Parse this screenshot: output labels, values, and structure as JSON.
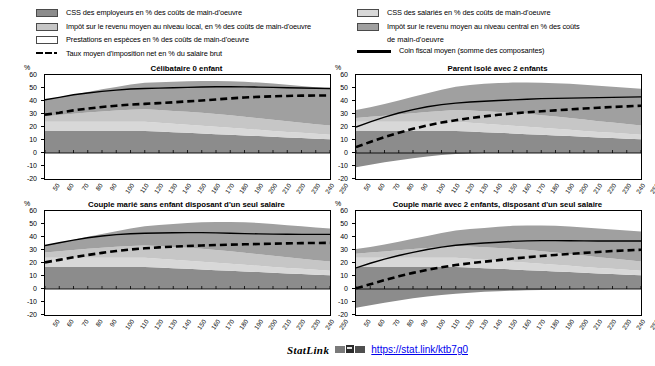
{
  "legend": {
    "left": [
      {
        "key": "area",
        "swatch": "employer",
        "color": "#8c8c8c",
        "label": "CSS des employeurs en % des coûts de main-d'oeuvre"
      },
      {
        "key": "area",
        "swatch": "local",
        "color": "#c6c6c6",
        "label": "Impôt sur le revenu moyen au niveau local, en % des coûts de main-d'oeuvre"
      },
      {
        "key": "area",
        "swatch": "benefit",
        "color": "#ffffff",
        "label": "Prestations en espèces en % des coûts de main-d'oeuvre"
      },
      {
        "key": "dashed",
        "color": "#000000",
        "label": "Taux moyen d'imposition net en % du salaire brut"
      }
    ],
    "right": [
      {
        "key": "area",
        "swatch": "employee",
        "color": "#d8d8d8",
        "label": "CSS des salariés en % des coûts de main-d'oeuvre"
      },
      {
        "key": "area",
        "swatch": "central",
        "color": "#a0a0a0",
        "label": "Impôt sur le revenu moyen au niveau central en %  des coûts",
        "label2": "de main-d'oeuvre"
      },
      {
        "key": "solid",
        "color": "#000000",
        "label": "Coin fiscal moyen (somme des composantes)"
      }
    ]
  },
  "axis": {
    "y_unit": "%",
    "y_ticks": [
      60,
      50,
      40,
      30,
      20,
      10,
      0,
      -10,
      -20
    ],
    "y_min": -20,
    "y_max": 60,
    "x_ticks": [
      50,
      60,
      70,
      80,
      90,
      100,
      110,
      120,
      130,
      140,
      150,
      160,
      170,
      180,
      190,
      200,
      210,
      220,
      230,
      240,
      250
    ],
    "x_min": 50,
    "x_max": 250
  },
  "footer": {
    "statlink_word": "StatLink",
    "url": "https://stat.link/ktb7g0"
  },
  "chart_data": [
    {
      "type": "area",
      "title": "Célibataire 0 enfant",
      "xlabel": "",
      "ylabel": "%",
      "xlim": [
        50,
        250
      ],
      "ylim": [
        -20,
        60
      ],
      "grid": false,
      "legend_position": "top",
      "x": [
        50,
        60,
        70,
        80,
        90,
        100,
        110,
        120,
        130,
        140,
        150,
        160,
        170,
        180,
        190,
        200,
        210,
        220,
        230,
        240,
        250
      ],
      "series": [
        {
          "name": "CSS des employeurs en % des coûts de main-d'oeuvre",
          "color": "#8c8c8c",
          "values": [
            17,
            17,
            17,
            17,
            17,
            17,
            17,
            17,
            16.5,
            16,
            15.5,
            15,
            14.5,
            14,
            13.5,
            13,
            12.5,
            12,
            11.5,
            11,
            10.5
          ]
        },
        {
          "name": "CSS des salariés en % des coûts de main-d'oeuvre",
          "color": "#d8d8d8",
          "values": [
            7,
            7,
            7,
            7,
            7,
            7,
            7,
            7,
            6.8,
            6.5,
            6.2,
            6,
            5.7,
            5.4,
            5.1,
            4.8,
            4.5,
            4.2,
            4,
            3.8,
            3.6
          ]
        },
        {
          "name": "Impôt sur le revenu moyen au niveau local, en % des coûts de main-d'oeuvre",
          "color": "#c6c6c6",
          "values": [
            4,
            5.2,
            6.2,
            7.2,
            8.0,
            8.6,
            9.2,
            9.6,
            9.8,
            9.9,
            10.0,
            10.0,
            9.8,
            9.6,
            9.3,
            9.0,
            8.6,
            8.2,
            7.8,
            7.4,
            7.0
          ]
        },
        {
          "name": "Impôt sur le revenu moyen au niveau central en %  des coûts de main-d'oeuvre",
          "color": "#a0a0a0",
          "values": [
            13,
            13.6,
            14.6,
            15.8,
            17.0,
            18.2,
            19.4,
            20.4,
            21.4,
            22.4,
            23.4,
            24.4,
            25.4,
            26.2,
            26.9,
            27.4,
            27.8,
            28.1,
            28.3,
            28.4,
            28.5
          ]
        },
        {
          "name": "Prestations en espèces en % des coûts de main-d'oeuvre",
          "color": "#ffffff",
          "values": [
            0,
            0,
            0,
            0,
            0,
            0,
            0,
            0,
            0,
            0,
            0,
            0,
            0,
            0,
            0,
            0,
            0,
            0,
            0,
            0,
            0
          ]
        }
      ],
      "lines": [
        {
          "name": "Coin fiscal moyen (somme des composantes)",
          "style": "solid",
          "color": "#000000",
          "values": [
            41,
            42.8,
            44.8,
            46.2,
            47.4,
            48.4,
            49.2,
            49.6,
            49.9,
            50.2,
            50.5,
            50.8,
            51.0,
            51.0,
            50.9,
            50.7,
            50.5,
            50.2,
            50.0,
            49.8,
            49.6
          ]
        },
        {
          "name": "Taux moyen d'imposition net en % du salaire brut",
          "style": "dashed",
          "color": "#000000",
          "values": [
            29.5,
            31.0,
            32.8,
            34.2,
            35.4,
            36.4,
            37.2,
            37.8,
            38.4,
            39.0,
            39.7,
            40.4,
            41.2,
            42.0,
            42.7,
            43.2,
            43.6,
            43.9,
            44.1,
            44.2,
            44.3
          ]
        }
      ]
    },
    {
      "type": "area",
      "title": "Parent isolé avec 2 enfants",
      "xlabel": "",
      "ylabel": "%",
      "xlim": [
        50,
        250
      ],
      "ylim": [
        -20,
        60
      ],
      "grid": false,
      "legend_position": "top",
      "x": [
        50,
        60,
        70,
        80,
        90,
        100,
        110,
        120,
        130,
        140,
        150,
        160,
        170,
        180,
        190,
        200,
        210,
        220,
        230,
        240,
        250
      ],
      "series": [
        {
          "name": "CSS des employeurs en % des coûts de main-d'oeuvre",
          "color": "#8c8c8c",
          "values": [
            17,
            17,
            17,
            17,
            17,
            17,
            17,
            17,
            16.5,
            16,
            15.5,
            15,
            14.5,
            14,
            13.5,
            13,
            12.5,
            12,
            11.5,
            11,
            10.5
          ]
        },
        {
          "name": "CSS des salariés en % des coûts de main-d'oeuvre",
          "color": "#d8d8d8",
          "values": [
            7,
            7,
            7,
            7,
            7,
            7,
            7,
            7,
            6.8,
            6.5,
            6.2,
            6,
            5.7,
            5.4,
            5.1,
            4.8,
            4.5,
            4.2,
            4,
            3.8,
            3.6
          ]
        },
        {
          "name": "Impôt sur le revenu moyen au niveau local, en % des coûts de main-d'oeuvre",
          "color": "#c6c6c6",
          "values": [
            3.0,
            3.8,
            4.6,
            5.6,
            6.6,
            7.6,
            8.4,
            9.0,
            9.4,
            9.7,
            9.9,
            10.0,
            9.9,
            9.7,
            9.4,
            9.1,
            8.7,
            8.3,
            7.9,
            7.5,
            7.1
          ]
        },
        {
          "name": "Impôt sur le revenu moyen au niveau central en %  des coûts de main-d'oeuvre",
          "color": "#a0a0a0",
          "values": [
            6.0,
            7.4,
            9.0,
            10.8,
            12.6,
            14.4,
            16.2,
            18.0,
            19.6,
            21.0,
            22.2,
            23.2,
            24.2,
            25.0,
            25.7,
            26.3,
            26.8,
            27.2,
            27.6,
            27.9,
            28.2
          ]
        },
        {
          "name": "Prestations en espèces en % des coûts de main-d'oeuvre",
          "color": "#ffffff",
          "values": [
            -11.0,
            -9.0,
            -7.2,
            -5.5,
            -4.0,
            -2.6,
            -1.6,
            -0.8,
            -0.3,
            0,
            0,
            0,
            0,
            0,
            0,
            0,
            0,
            0,
            0,
            0,
            0
          ]
        }
      ],
      "lines": [
        {
          "name": "Coin fiscal moyen (somme des composantes)",
          "style": "solid",
          "color": "#000000",
          "values": [
            20.0,
            24.0,
            27.6,
            30.8,
            33.4,
            35.6,
            37.2,
            38.4,
            39.2,
            39.8,
            40.4,
            40.9,
            41.4,
            41.8,
            42.0,
            42.2,
            42.4,
            42.6,
            42.8,
            43.0,
            43.2
          ]
        },
        {
          "name": "Taux moyen d'imposition net en % du salaire brut",
          "style": "dashed",
          "color": "#000000",
          "values": [
            4.5,
            8.5,
            12.2,
            15.6,
            18.6,
            21.2,
            23.4,
            25.2,
            26.8,
            28.2,
            29.4,
            30.4,
            31.3,
            32.1,
            32.8,
            33.5,
            34.2,
            34.8,
            35.4,
            35.9,
            36.4
          ]
        }
      ]
    },
    {
      "type": "area",
      "title": "Couple marié sans enfant disposant d'un seul salaire",
      "xlabel": "",
      "ylabel": "%",
      "xlim": [
        50,
        250
      ],
      "ylim": [
        -20,
        60
      ],
      "grid": false,
      "legend_position": "top",
      "x": [
        50,
        60,
        70,
        80,
        90,
        100,
        110,
        120,
        130,
        140,
        150,
        160,
        170,
        180,
        190,
        200,
        210,
        220,
        230,
        240,
        250
      ],
      "series": [
        {
          "name": "CSS des employeurs en % des coûts de main-d'oeuvre",
          "color": "#8c8c8c",
          "values": [
            17,
            17,
            17,
            17,
            17,
            17,
            17,
            17,
            16.5,
            16,
            15.5,
            15,
            14.5,
            14,
            13.5,
            13,
            12.5,
            12,
            11.5,
            11,
            10.5
          ]
        },
        {
          "name": "CSS des salariés en % des coûts de main-d'oeuvre",
          "color": "#d8d8d8",
          "values": [
            7,
            7,
            7,
            7,
            7,
            7,
            7,
            7,
            6.8,
            6.5,
            6.2,
            6,
            5.7,
            5.4,
            5.1,
            4.8,
            4.5,
            4.2,
            4,
            3.8,
            3.6
          ]
        },
        {
          "name": "Impôt sur le revenu moyen au niveau local, en % des coûts de main-d'oeuvre",
          "color": "#c6c6c6",
          "values": [
            4.0,
            5.0,
            6.0,
            7.0,
            7.8,
            8.5,
            9.1,
            9.5,
            9.8,
            9.9,
            10.0,
            10.0,
            9.8,
            9.6,
            9.3,
            9.0,
            8.6,
            8.2,
            7.8,
            7.4,
            7.0
          ]
        },
        {
          "name": "Impôt sur le revenu moyen au niveau central en %  des coûts de main-d'oeuvre",
          "color": "#a0a0a0",
          "values": [
            5.5,
            6.6,
            7.8,
            9.2,
            10.6,
            12.0,
            13.4,
            14.8,
            16.2,
            17.6,
            19.0,
            20.4,
            21.6,
            22.6,
            23.4,
            24.0,
            24.4,
            24.7,
            25.0,
            25.2,
            25.4
          ]
        },
        {
          "name": "Prestations en espèces en % des coûts de main-d'oeuvre",
          "color": "#ffffff",
          "values": [
            0,
            0,
            0,
            0,
            0,
            0,
            0,
            0,
            0,
            0,
            0,
            0,
            0,
            0,
            0,
            0,
            0,
            0,
            0,
            0,
            0
          ]
        }
      ],
      "lines": [
        {
          "name": "Coin fiscal moyen (somme des composantes)",
          "style": "solid",
          "color": "#000000",
          "values": [
            33.5,
            35.6,
            37.6,
            39.4,
            40.8,
            41.8,
            42.5,
            42.9,
            43.1,
            43.3,
            43.4,
            43.4,
            43.2,
            42.9,
            42.6,
            42.4,
            42.2,
            42.1,
            42.0,
            42.0,
            42.0
          ]
        },
        {
          "name": "Taux moyen d'imposition net en % du salaire brut",
          "style": "dashed",
          "color": "#000000",
          "values": [
            20.5,
            22.4,
            24.4,
            26.2,
            27.8,
            29.2,
            30.4,
            31.3,
            32.0,
            32.6,
            33.1,
            33.5,
            33.8,
            34.1,
            34.4,
            34.6,
            34.9,
            35.1,
            35.3,
            35.4,
            35.5
          ]
        }
      ]
    },
    {
      "type": "area",
      "title": "Couple marié avec 2 enfants, disposant d'un seul salaire",
      "xlabel": "",
      "ylabel": "%",
      "xlim": [
        50,
        250
      ],
      "ylim": [
        -20,
        60
      ],
      "grid": false,
      "legend_position": "top",
      "x": [
        50,
        60,
        70,
        80,
        90,
        100,
        110,
        120,
        130,
        140,
        150,
        160,
        170,
        180,
        190,
        200,
        210,
        220,
        230,
        240,
        250
      ],
      "series": [
        {
          "name": "CSS des employeurs en % des coûts de main-d'oeuvre",
          "color": "#8c8c8c",
          "values": [
            17,
            17,
            17,
            17,
            17,
            17,
            17,
            17,
            16.5,
            16,
            15.5,
            15,
            14.5,
            14,
            13.5,
            13,
            12.5,
            12,
            11.5,
            11,
            10.5
          ]
        },
        {
          "name": "CSS des salariés en % des coûts de main-d'oeuvre",
          "color": "#d8d8d8",
          "values": [
            7,
            7,
            7,
            7,
            7,
            7,
            7,
            7,
            6.8,
            6.5,
            6.2,
            6,
            5.7,
            5.4,
            5.1,
            4.8,
            4.5,
            4.2,
            4,
            3.8,
            3.6
          ]
        },
        {
          "name": "Impôt sur le revenu moyen au niveau local, en % des coûts de main-d'oeuvre",
          "color": "#c6c6c6",
          "values": [
            3.2,
            4.0,
            4.8,
            5.8,
            6.8,
            7.6,
            8.4,
            9.0,
            9.4,
            9.7,
            9.9,
            10.0,
            9.9,
            9.7,
            9.4,
            9.1,
            8.7,
            8.3,
            7.9,
            7.5,
            7.1
          ]
        },
        {
          "name": "Impôt sur le revenu moyen au niveau central en %  des coûts de main-d'oeuvre",
          "color": "#a0a0a0",
          "values": [
            3.5,
            4.4,
            5.4,
            6.6,
            7.8,
            9.2,
            10.6,
            12.0,
            13.4,
            14.8,
            16.2,
            17.6,
            18.8,
            19.8,
            20.6,
            21.2,
            21.7,
            22.1,
            22.4,
            22.7,
            23.0
          ]
        },
        {
          "name": "Prestations en espèces en % des coûts de main-d'oeuvre",
          "color": "#ffffff",
          "values": [
            -14.5,
            -12.5,
            -10.6,
            -8.8,
            -7.2,
            -5.8,
            -4.6,
            -3.6,
            -2.8,
            -2.2,
            -1.7,
            -1.3,
            -1.0,
            -0.7,
            -0.5,
            -0.3,
            -0.2,
            -0.1,
            0,
            0,
            0
          ]
        }
      ],
      "lines": [
        {
          "name": "Coin fiscal moyen (somme des composantes)",
          "style": "solid",
          "color": "#000000",
          "values": [
            16.2,
            19.8,
            23.0,
            25.8,
            28.2,
            30.4,
            32.2,
            33.6,
            34.6,
            35.4,
            36.0,
            36.6,
            37.0,
            37.2,
            37.2,
            37.1,
            37.0,
            36.9,
            36.9,
            36.9,
            36.9
          ]
        },
        {
          "name": "Taux moyen d'imposition net en % du salaire brut",
          "style": "dashed",
          "color": "#000000",
          "values": [
            0.5,
            3.6,
            6.8,
            9.8,
            12.4,
            14.8,
            16.8,
            18.4,
            19.8,
            21.0,
            22.2,
            23.4,
            24.4,
            25.4,
            26.2,
            27.0,
            27.8,
            28.5,
            29.2,
            29.7,
            30.2
          ]
        }
      ]
    }
  ]
}
